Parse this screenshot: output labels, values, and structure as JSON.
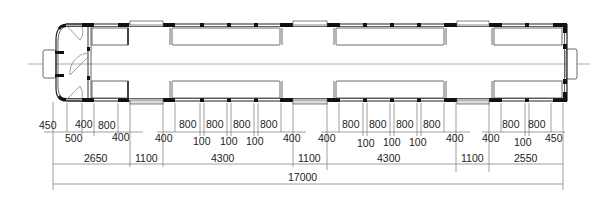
{
  "drawing": {
    "type": "vehicle floor plan",
    "colors": {
      "line": "#333333",
      "wall": "#111111",
      "window": "#888888",
      "centerline": "#999999"
    }
  },
  "dimensions": {
    "row1": [
      {
        "label": "450",
        "x": 48
      },
      {
        "label": "400",
        "x": 84
      },
      {
        "label": "800",
        "x": 108
      },
      {
        "label": "800",
        "x": 189
      },
      {
        "label": "800",
        "x": 215
      },
      {
        "label": "800",
        "x": 242
      },
      {
        "label": "800",
        "x": 269
      },
      {
        "label": "800",
        "x": 352
      },
      {
        "label": "800",
        "x": 378
      },
      {
        "label": "800",
        "x": 405
      },
      {
        "label": "800",
        "x": 432
      },
      {
        "label": "800",
        "x": 510
      },
      {
        "label": "800",
        "x": 537
      },
      {
        "label": "450",
        "x": 553
      }
    ],
    "row2": [
      {
        "label": "500",
        "x": 74
      },
      {
        "label": "400",
        "x": 122
      },
      {
        "label": "400",
        "x": 164
      },
      {
        "label": "100",
        "x": 202
      },
      {
        "label": "100",
        "x": 229
      },
      {
        "label": "100",
        "x": 255
      },
      {
        "label": "400",
        "x": 292
      },
      {
        "label": "400",
        "x": 327
      },
      {
        "label": "100",
        "x": 365
      },
      {
        "label": "100",
        "x": 391
      },
      {
        "label": "100",
        "x": 418
      },
      {
        "label": "400",
        "x": 455
      },
      {
        "label": "400",
        "x": 490
      },
      {
        "label": "100",
        "x": 522
      }
    ],
    "row3": [
      {
        "label": "2650",
        "x": 96
      },
      {
        "label": "1100",
        "x": 147
      },
      {
        "label": "4300",
        "x": 222
      },
      {
        "label": "1100",
        "x": 310
      },
      {
        "label": "4300",
        "x": 390
      },
      {
        "label": "1100",
        "x": 473
      },
      {
        "label": "2550",
        "x": 526
      }
    ],
    "total": {
      "label": "17000",
      "x": 302
    }
  }
}
